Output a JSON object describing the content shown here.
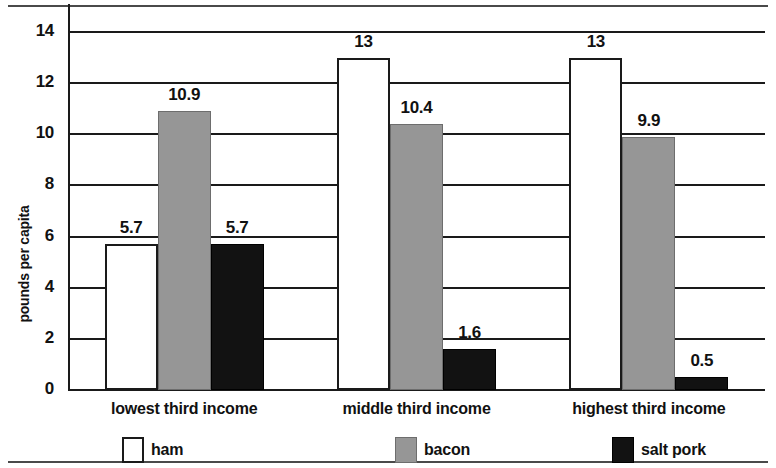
{
  "chart_data": {
    "type": "bar",
    "title": "",
    "xlabel": "",
    "ylabel": "pounds per capita",
    "ylim": [
      0,
      14
    ],
    "yticks": [
      "0",
      "2",
      "4",
      "6",
      "8",
      "10",
      "12",
      "14"
    ],
    "grid": true,
    "legend_position": "bottom",
    "categories": [
      "lowest third income",
      "middle third income",
      "highest third income"
    ],
    "series": [
      {
        "name": "ham",
        "color": "#ffffff",
        "values": [
          5.7,
          13,
          13
        ],
        "labels": [
          "5.7",
          "13",
          "13"
        ]
      },
      {
        "name": "bacon",
        "color": "#969696",
        "values": [
          10.9,
          10.4,
          9.9
        ],
        "labels": [
          "10.9",
          "10.4",
          "9.9"
        ]
      },
      {
        "name": "salt pork",
        "color": "#121212",
        "values": [
          5.7,
          1.6,
          0.5
        ],
        "labels": [
          "5.7",
          "1.6",
          "0.5"
        ]
      }
    ]
  },
  "legend": {
    "items": [
      {
        "label": "ham",
        "swatch": "white"
      },
      {
        "label": "bacon",
        "swatch": "gray"
      },
      {
        "label": "salt pork",
        "swatch": "black"
      }
    ]
  },
  "axis": {
    "y_title": "pounds per capita"
  }
}
